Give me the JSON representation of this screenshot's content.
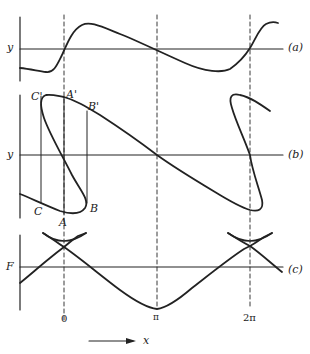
{
  "figure": {
    "panels": [
      {
        "id": "a",
        "label": "(a)",
        "axis_label": "y",
        "description": "displacement y versus x, periodic with zero crossings near 0 and 2π and π"
      },
      {
        "id": "b",
        "label": "(b)",
        "axis_label": "y",
        "description": "multivalued (folded) y versus x with overhang; points A, B, C, A', B', C' mark vertical constructions",
        "points": [
          "A",
          "B",
          "C",
          "A'",
          "B'",
          "C'"
        ]
      },
      {
        "id": "c",
        "label": "(c)",
        "axis_label": "F",
        "description": "F versus x with swallowtail cusps at 0 and 2π, minimum at π"
      }
    ],
    "x_ticks": [
      "0",
      "π",
      "2π"
    ],
    "x_axis_label": "x",
    "points": {
      "A": "A",
      "B": "B",
      "C": "C",
      "A_prime": "A'",
      "B_prime": "B'",
      "C_prime": "C'"
    }
  },
  "colors": {
    "ink": "#222222",
    "background": "#ffffff"
  }
}
